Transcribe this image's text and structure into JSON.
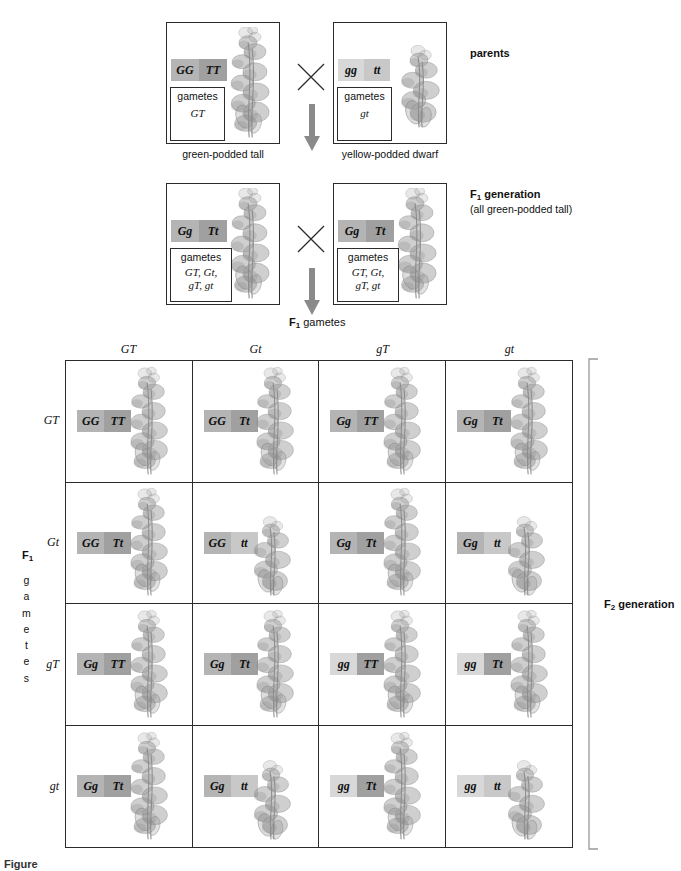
{
  "diagram": {
    "cross_symbol": "×",
    "gamete_word": "gametes"
  },
  "colors": {
    "dominant_pod_box": "#b4b4b4",
    "recessive_pod_box": "#d8d8d8",
    "dominant_height_box": "#a0a0a0",
    "recessive_height_box": "#c8c8c8",
    "line": "#2b2b2b",
    "plant": "#8d8d8d",
    "arrow": "#8a8a8a"
  },
  "parents": {
    "label": "parents",
    "left": {
      "allele_pod": "GG",
      "allele_height": "TT",
      "gametes_label": "gametes",
      "gametes": "GT",
      "caption": "green-podded tall",
      "plant_type": "tall"
    },
    "right": {
      "allele_pod": "gg",
      "allele_height": "tt",
      "gametes_label": "gametes",
      "gametes": "gt",
      "caption": "yellow-podded dwarf",
      "plant_type": "dwarf"
    }
  },
  "f1": {
    "label": "F",
    "label_sub": "1",
    "label_rest": " generation",
    "sublabel": "(all green-podded tall)",
    "left": {
      "allele_pod": "Gg",
      "allele_height": "Tt",
      "gametes_label": "gametes",
      "gametes_line1": "GT, Gt,",
      "gametes_line2": "gT, gt",
      "plant_type": "tall"
    },
    "right": {
      "allele_pod": "Gg",
      "allele_height": "Tt",
      "gametes_label": "gametes",
      "gametes_line1": "GT, Gt,",
      "gametes_line2": "gT, gt",
      "plant_type": "tall"
    }
  },
  "gametes_header": {
    "prefix": "F",
    "sub": "1",
    "text": " gametes"
  },
  "row_axis": {
    "prefix": "F",
    "sub": "1",
    "stacked": [
      "g",
      "a",
      "m",
      "e",
      "t",
      "e",
      "s"
    ]
  },
  "f2": {
    "label_prefix": "F",
    "label_sub": "2",
    "label_rest": " generation"
  },
  "punnett": {
    "columns": [
      "GT",
      "Gt",
      "gT",
      "gt"
    ],
    "rows": [
      "GT",
      "Gt",
      "gT",
      "gt"
    ],
    "cells": [
      {
        "pod": "GG",
        "height": "TT",
        "plant_type": "tall"
      },
      {
        "pod": "GG",
        "height": "Tt",
        "plant_type": "tall"
      },
      {
        "pod": "Gg",
        "height": "TT",
        "plant_type": "tall"
      },
      {
        "pod": "Gg",
        "height": "Tt",
        "plant_type": "tall"
      },
      {
        "pod": "GG",
        "height": "Tt",
        "plant_type": "tall"
      },
      {
        "pod": "GG",
        "height": "tt",
        "plant_type": "dwarf"
      },
      {
        "pod": "Gg",
        "height": "Tt",
        "plant_type": "tall"
      },
      {
        "pod": "Gg",
        "height": "tt",
        "plant_type": "dwarf"
      },
      {
        "pod": "Gg",
        "height": "TT",
        "plant_type": "tall"
      },
      {
        "pod": "Gg",
        "height": "Tt",
        "plant_type": "tall"
      },
      {
        "pod": "gg",
        "height": "TT",
        "plant_type": "tall"
      },
      {
        "pod": "gg",
        "height": "Tt",
        "plant_type": "tall"
      },
      {
        "pod": "Gg",
        "height": "Tt",
        "plant_type": "tall"
      },
      {
        "pod": "Gg",
        "height": "tt",
        "plant_type": "dwarf"
      },
      {
        "pod": "gg",
        "height": "Tt",
        "plant_type": "tall"
      },
      {
        "pod": "gg",
        "height": "tt",
        "plant_type": "dwarf"
      }
    ]
  },
  "figure_caption": {
    "number": "Figure",
    "text": ""
  }
}
